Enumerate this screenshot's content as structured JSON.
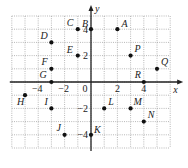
{
  "chart_data": {
    "type": "scatter",
    "title": "",
    "xlabel": "x",
    "ylabel": "y",
    "xlim": [
      -6,
      6
    ],
    "ylim": [
      -5,
      5
    ],
    "grid": true,
    "grid_style": "dotted",
    "x_ticks": [
      -4,
      -2,
      0,
      2,
      4
    ],
    "y_ticks": [
      4,
      2,
      -2,
      -4
    ],
    "x_tick_labels": [
      "-4",
      "-2",
      "0",
      "2",
      "4"
    ],
    "y_tick_labels": [
      "4",
      "2",
      "-2",
      "-4"
    ],
    "points": [
      {
        "label": "A",
        "x": 2,
        "y": 4
      },
      {
        "label": "B",
        "x": 0,
        "y": 4
      },
      {
        "label": "C",
        "x": -1,
        "y": 4
      },
      {
        "label": "D",
        "x": -3,
        "y": 3
      },
      {
        "label": "E",
        "x": -1,
        "y": 2
      },
      {
        "label": "F",
        "x": -3,
        "y": 1
      },
      {
        "label": "G",
        "x": -3,
        "y": 0
      },
      {
        "label": "H",
        "x": -5,
        "y": -1
      },
      {
        "label": "I",
        "x": -3,
        "y": -2
      },
      {
        "label": "J",
        "x": -2,
        "y": -4
      },
      {
        "label": "K",
        "x": 0,
        "y": -4
      },
      {
        "label": "L",
        "x": 1,
        "y": -2
      },
      {
        "label": "M",
        "x": 3,
        "y": -2
      },
      {
        "label": "N",
        "x": 4,
        "y": -3
      },
      {
        "label": "P",
        "x": 3,
        "y": 2
      },
      {
        "label": "Q",
        "x": 5,
        "y": 1
      },
      {
        "label": "R",
        "x": 4,
        "y": 0
      }
    ],
    "colors": {
      "grid": "#9a9a9a",
      "axis": "#222222",
      "point": "#111111"
    }
  }
}
